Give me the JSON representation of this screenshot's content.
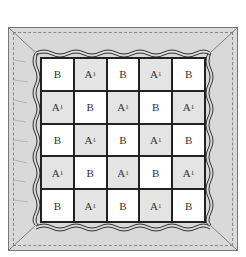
{
  "diagram": {
    "grid": [
      [
        "B",
        "A1",
        "B",
        "A1",
        "B"
      ],
      [
        "A1",
        "B",
        "A1",
        "B",
        "A1"
      ],
      [
        "B",
        "A1",
        "B",
        "A1",
        "B"
      ],
      [
        "A1",
        "B",
        "A1",
        "B",
        "A1"
      ],
      [
        "B",
        "A1",
        "B",
        "A1",
        "B"
      ]
    ],
    "labels": {
      "B": "B",
      "A1_main": "A",
      "A1_sub": "1"
    },
    "colors": {
      "frame": "#d9d9d9",
      "shaded_cell": "#e4e4e4",
      "plain_cell": "#ffffff",
      "lines": "#222222"
    }
  }
}
